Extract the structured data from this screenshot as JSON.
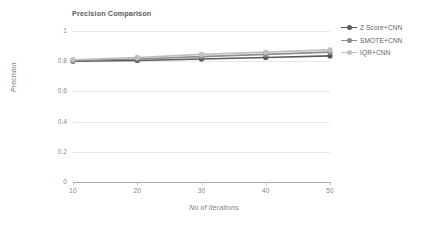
{
  "chart_data": {
    "type": "line",
    "title": "Precision Comparison",
    "xlabel": "No of Iterations",
    "ylabel": "Precision",
    "categories": [
      10,
      20,
      30,
      40,
      50
    ],
    "x": [
      10,
      20,
      30,
      40,
      50
    ],
    "xlim": [
      10,
      50
    ],
    "ylim": [
      0,
      1
    ],
    "yticks": [
      0,
      0.2,
      0.4,
      0.6,
      0.8,
      1
    ],
    "ytick_labels": [
      "0",
      "0.2",
      "0.4",
      "0.6",
      "0.8",
      "1"
    ],
    "xtick_labels": [
      "10",
      "20",
      "30",
      "40",
      "50"
    ],
    "grid": true,
    "grid_axis": "y",
    "legend_position": "right",
    "marker": "circle",
    "series": [
      {
        "name": "Z Score+CNN",
        "color": "#595959",
        "values": [
          0.8,
          0.805,
          0.815,
          0.825,
          0.835
        ]
      },
      {
        "name": "SMOTE+CNN",
        "color": "#8c8c8c",
        "values": [
          0.805,
          0.815,
          0.83,
          0.845,
          0.86
        ]
      },
      {
        "name": "IQR+CNN",
        "color": "#bfbfbf",
        "values": [
          0.81,
          0.825,
          0.845,
          0.86,
          0.875
        ]
      }
    ]
  },
  "colors": {
    "axis": "#a9a9a9",
    "grid": "#e8e8e8",
    "text": "#7a7a7a",
    "title": "#5a5a5a",
    "background": "#ffffff"
  }
}
